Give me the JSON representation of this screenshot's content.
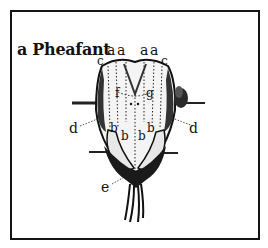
{
  "figure": {
    "title": "a Pheafant",
    "labels": {
      "a1": "a",
      "a2": "a",
      "a3": "a",
      "a4": "a",
      "c_left": "c",
      "c_right": "c",
      "f": "f",
      "g": "g",
      "d_left": "d",
      "d_right": "d",
      "b1": "b",
      "b2": "b",
      "b3": "b",
      "b4": "b",
      "e": "e"
    },
    "colors": {
      "ink": "#111111",
      "paper": "#ffffff"
    }
  }
}
